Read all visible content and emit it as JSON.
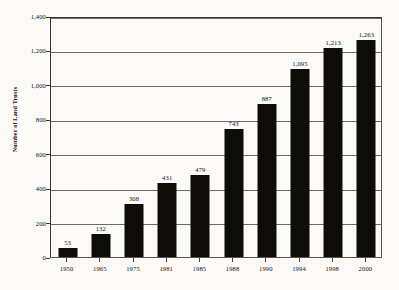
{
  "chart_data": {
    "type": "bar",
    "title": "",
    "xlabel": "",
    "ylabel": "Number of Land Trusts",
    "categories": [
      "1950",
      "1965",
      "1975",
      "1981",
      "1985",
      "1988",
      "1990",
      "1994",
      "1998",
      "2000"
    ],
    "values": [
      53,
      132,
      308,
      431,
      479,
      743,
      887,
      1095,
      1213,
      1263
    ],
    "value_labels": [
      "53",
      "132",
      "308",
      "431",
      "479",
      "743",
      "887",
      "1,095",
      "1,213",
      "1,263"
    ],
    "ylim": [
      0,
      1400
    ],
    "ytick_values": [
      0,
      200,
      400,
      600,
      800,
      1000,
      1200,
      1400
    ],
    "ytick_labels": [
      "0",
      "200",
      "400",
      "600",
      "800",
      "1,000",
      "1,200",
      "1,400"
    ],
    "grid": true,
    "legend": null,
    "bar_color": "#0d0c0a",
    "gridline_color": "#6e6b66",
    "background_color": "#fbfaf7"
  }
}
